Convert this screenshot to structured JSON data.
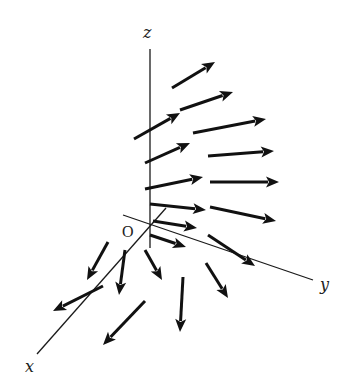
{
  "figure": {
    "type": "3d-vector-field",
    "colors": {
      "background": "#ffffff",
      "ink": "#111111"
    },
    "axes": {
      "origin": {
        "label": "O",
        "point": [
          150,
          224
        ],
        "label_pos": [
          122,
          237
        ]
      },
      "z": {
        "label": "z",
        "from": [
          150,
          49
        ],
        "to": [
          150,
          248
        ],
        "label_pos": [
          143,
          38
        ]
      },
      "y": {
        "label": "y",
        "from": [
          123,
          215
        ],
        "to": [
          313,
          280
        ],
        "label_pos": [
          320,
          290
        ]
      },
      "x": {
        "label": "x",
        "from": [
          166,
          208
        ],
        "to": [
          37,
          354
        ],
        "label_pos": [
          25,
          372
        ]
      }
    },
    "vectors": [
      {
        "from": [
          172,
          88
        ],
        "to": [
          215,
          62
        ]
      },
      {
        "from": [
          180,
          110
        ],
        "to": [
          233,
          92
        ]
      },
      {
        "from": [
          134,
          139
        ],
        "to": [
          180,
          113
        ]
      },
      {
        "from": [
          193,
          133
        ],
        "to": [
          266,
          119
        ]
      },
      {
        "from": [
          145,
          163
        ],
        "to": [
          190,
          143
        ]
      },
      {
        "from": [
          208,
          156
        ],
        "to": [
          274,
          151
        ]
      },
      {
        "from": [
          145,
          189
        ],
        "to": [
          203,
          177
        ]
      },
      {
        "from": [
          210,
          182
        ],
        "to": [
          279,
          182
        ]
      },
      {
        "from": [
          150,
          204
        ],
        "to": [
          206,
          210
        ]
      },
      {
        "from": [
          210,
          207
        ],
        "to": [
          276,
          221
        ]
      },
      {
        "from": [
          153,
          221
        ],
        "to": [
          197,
          228
        ]
      },
      {
        "from": [
          150,
          235
        ],
        "to": [
          186,
          247
        ]
      },
      {
        "from": [
          208,
          235
        ],
        "to": [
          255,
          266
        ]
      },
      {
        "from": [
          108,
          242
        ],
        "to": [
          87,
          280
        ]
      },
      {
        "from": [
          125,
          250
        ],
        "to": [
          119,
          295
        ]
      },
      {
        "from": [
          145,
          250
        ],
        "to": [
          162,
          280
        ]
      },
      {
        "from": [
          206,
          263
        ],
        "to": [
          228,
          298
        ]
      },
      {
        "from": [
          103,
          286
        ],
        "to": [
          53,
          311
        ]
      },
      {
        "from": [
          183,
          277
        ],
        "to": [
          180,
          332
        ]
      },
      {
        "from": [
          145,
          301
        ],
        "to": [
          103,
          345
        ]
      }
    ]
  }
}
